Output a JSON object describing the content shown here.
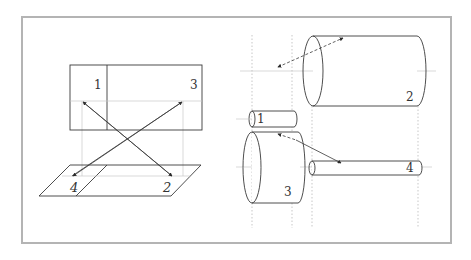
{
  "diagram": {
    "title": "",
    "left_panel": {
      "description": "Rectangle mapped onto parallelogram with crossing arrows",
      "rect_labels": [
        "1",
        "3"
      ],
      "parallelogram_labels": [
        "4",
        "2"
      ],
      "arrows": [
        {
          "from": "4",
          "to": "1"
        },
        {
          "from": "4",
          "to": "3"
        },
        {
          "from": "1",
          "to": "2"
        },
        {
          "from": "3",
          "to": "4"
        }
      ]
    },
    "right_panel": {
      "description": "Cylinders of varying sizes with projection guidelines",
      "cylinders": [
        {
          "label": "1",
          "size": "small"
        },
        {
          "label": "2",
          "size": "large"
        },
        {
          "label": "3",
          "size": "short-wide"
        },
        {
          "label": "4",
          "size": "long-thin"
        }
      ],
      "arrows": [
        {
          "between": [
            "1",
            "2"
          ],
          "style": "dashed-double"
        },
        {
          "between": [
            "3",
            "4"
          ],
          "style": "dashed-to-solid"
        }
      ]
    }
  }
}
